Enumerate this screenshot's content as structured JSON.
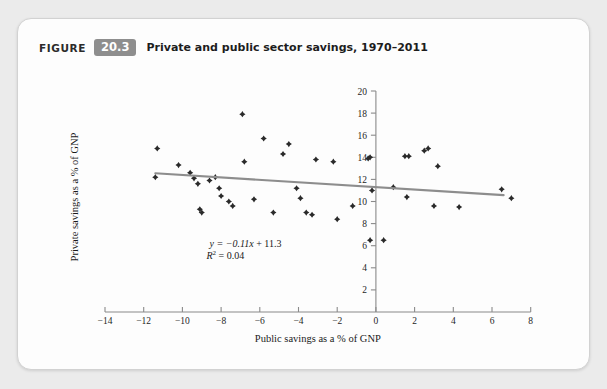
{
  "figure": {
    "label": "FIGURE",
    "number": "20.3",
    "title": "Private and public sector savings, 1970–2011"
  },
  "colors": {
    "card_background": "#fdfdfd",
    "page_background": "#ebebeb",
    "badge": "#8e8e8e",
    "point": "#2a2a2a",
    "trend_line": "#8d8d8d",
    "axis": "#8a8a8a"
  },
  "chart_data": {
    "type": "scatter",
    "title": "Private and public sector savings, 1970–2011",
    "xlabel": "Public savings as a % of GNP",
    "ylabel": "Private savings as a % of GNP",
    "xlim": [
      -14,
      8
    ],
    "ylim": [
      0,
      20
    ],
    "xticks": [
      -14,
      -12,
      -10,
      -8,
      -6,
      -4,
      -2,
      0,
      2,
      4,
      6,
      8
    ],
    "xtick_labels": [
      "−14",
      "−12",
      "−10",
      "−8",
      "−6",
      "−4",
      "−2",
      "0",
      "2",
      "4",
      "6",
      "8"
    ],
    "yticks": [
      2,
      4,
      6,
      8,
      10,
      12,
      14,
      16,
      18,
      20
    ],
    "ytick_labels": [
      "2",
      "4",
      "6",
      "8",
      "10",
      "12",
      "14",
      "16",
      "18",
      "20"
    ],
    "grid": false,
    "legend": "none",
    "points": [
      {
        "x": -11.4,
        "y": 12.2
      },
      {
        "x": -11.3,
        "y": 14.8
      },
      {
        "x": -10.2,
        "y": 13.3
      },
      {
        "x": -9.6,
        "y": 12.6
      },
      {
        "x": -9.4,
        "y": 12.1
      },
      {
        "x": -9.2,
        "y": 11.6
      },
      {
        "x": -9.1,
        "y": 9.3
      },
      {
        "x": -9.0,
        "y": 9.0
      },
      {
        "x": -8.6,
        "y": 11.9
      },
      {
        "x": -8.3,
        "y": 12.2
      },
      {
        "x": -8.1,
        "y": 11.2
      },
      {
        "x": -8.0,
        "y": 10.5
      },
      {
        "x": -7.6,
        "y": 10.0
      },
      {
        "x": -7.4,
        "y": 9.6
      },
      {
        "x": -6.9,
        "y": 17.9
      },
      {
        "x": -6.8,
        "y": 13.6
      },
      {
        "x": -6.3,
        "y": 10.2
      },
      {
        "x": -5.8,
        "y": 15.7
      },
      {
        "x": -5.3,
        "y": 9.0
      },
      {
        "x": -4.8,
        "y": 14.3
      },
      {
        "x": -4.5,
        "y": 15.2
      },
      {
        "x": -4.1,
        "y": 11.2
      },
      {
        "x": -3.9,
        "y": 10.3
      },
      {
        "x": -3.6,
        "y": 9.0
      },
      {
        "x": -3.3,
        "y": 8.8
      },
      {
        "x": -3.1,
        "y": 13.8
      },
      {
        "x": -2.2,
        "y": 13.6
      },
      {
        "x": -2.0,
        "y": 8.4
      },
      {
        "x": -1.2,
        "y": 9.6
      },
      {
        "x": -0.4,
        "y": 13.9
      },
      {
        "x": -0.3,
        "y": 14.0
      },
      {
        "x": -0.2,
        "y": 11.0
      },
      {
        "x": -0.3,
        "y": 6.5
      },
      {
        "x": 0.4,
        "y": 6.5
      },
      {
        "x": 0.9,
        "y": 11.3
      },
      {
        "x": 1.5,
        "y": 14.1
      },
      {
        "x": 1.7,
        "y": 14.1
      },
      {
        "x": 1.6,
        "y": 10.4
      },
      {
        "x": 2.5,
        "y": 14.6
      },
      {
        "x": 2.7,
        "y": 14.8
      },
      {
        "x": 3.2,
        "y": 13.2
      },
      {
        "x": 3.0,
        "y": 9.6
      },
      {
        "x": 4.3,
        "y": 9.5
      },
      {
        "x": 6.5,
        "y": 11.1
      },
      {
        "x": 7.0,
        "y": 10.3
      }
    ],
    "trend": {
      "slope": -0.11,
      "intercept": 11.3,
      "x_start": -11.4,
      "x_end": 6.6,
      "equation": "y = −0.11x + 11.3",
      "r_squared_label": "R",
      "r_squared_exponent": "2",
      "r_squared_value": "= 0.04"
    }
  }
}
